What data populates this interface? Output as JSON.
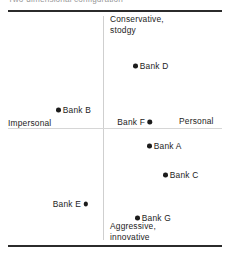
{
  "figure": {
    "caption": "Two-dimensional configuration",
    "width": 229,
    "height": 257,
    "marker_color": "#1c1c1c",
    "rule_color": "#2b2b2b",
    "axis_color": "#cfcfcf"
  },
  "chart_data": {
    "type": "scatter",
    "title": "Two-dimensional configuration",
    "xlabel": "",
    "ylabel": "",
    "grid": false,
    "legend": "none",
    "axis_pole_labels": {
      "left": "Impersonal",
      "right": "Personal",
      "top": "Conservative,\nstodgy",
      "bottom": "Aggressive,\ninnovative"
    },
    "xlim": [
      -1,
      1
    ],
    "ylim": [
      -1,
      1
    ],
    "points": [
      {
        "label": "Bank D",
        "x": 0.27,
        "y": 0.55,
        "px": 133,
        "py": 66,
        "label_side": "right"
      },
      {
        "label": "Bank B",
        "x": -0.44,
        "y": 0.16,
        "px": 56,
        "py": 110,
        "label_side": "right"
      },
      {
        "label": "Bank F",
        "x": 0.45,
        "y": 0.05,
        "px": 152,
        "py": 122,
        "label_side": "left"
      },
      {
        "label": "Bank A",
        "x": 0.4,
        "y": -0.16,
        "px": 147,
        "py": 146,
        "label_side": "right"
      },
      {
        "label": "Bank C",
        "x": 0.55,
        "y": -0.42,
        "px": 163,
        "py": 175,
        "label_side": "right"
      },
      {
        "label": "Bank E",
        "x": -0.14,
        "y": -0.68,
        "px": 88,
        "py": 204,
        "label_side": "left"
      },
      {
        "label": "Bank G",
        "x": 0.29,
        "y": -0.8,
        "px": 135,
        "py": 218,
        "label_side": "right"
      }
    ]
  }
}
